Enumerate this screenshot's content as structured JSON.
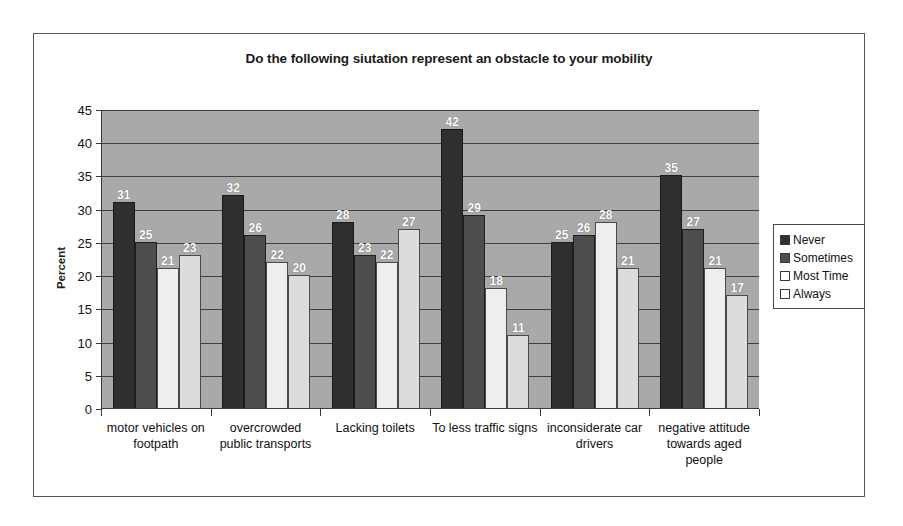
{
  "chart_data": {
    "type": "bar",
    "title": "Do the following siutation represent an obstacle to your mobility",
    "xlabel": "",
    "ylabel": "Percent",
    "ylim": [
      0,
      45
    ],
    "ytick_step": 5,
    "yticks": [
      45,
      40,
      35,
      30,
      25,
      20,
      15,
      10,
      5,
      0
    ],
    "grid": true,
    "legend_position": "right",
    "categories": [
      "motor vehicles on footpath",
      "overcrowded public transports",
      "Lacking toilets",
      "To less traffic signs",
      "inconsiderate car drivers",
      "negative attitude towards aged people"
    ],
    "series": [
      {
        "name": "Never",
        "color": "#2f2f2f",
        "values": [
          31,
          32,
          28,
          42,
          25,
          35
        ]
      },
      {
        "name": "Sometimes",
        "color": "#4d4d4d",
        "values": [
          25,
          26,
          23,
          29,
          26,
          27
        ]
      },
      {
        "name": "Most Time",
        "color": "#eeeeee",
        "values": [
          21,
          22,
          22,
          18,
          28,
          21
        ]
      },
      {
        "name": "Always",
        "color": "#dcdcdc",
        "values": [
          23,
          20,
          27,
          11,
          21,
          17
        ]
      }
    ],
    "plot_background": "#a9a9a9",
    "value_label_color": "#ffffff"
  },
  "legend": {
    "items": [
      {
        "label": "Never"
      },
      {
        "label": "Sometimes"
      },
      {
        "label": "Most Time"
      },
      {
        "label": "Always"
      }
    ]
  }
}
